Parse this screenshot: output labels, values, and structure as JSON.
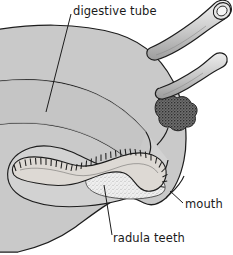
{
  "figure": {
    "background_color": "#ffffff",
    "width": 233,
    "height": 255
  },
  "labels": {
    "digestive_tube": "digestive tube",
    "mouth": "mouth",
    "radula_teeth": "radula teeth"
  },
  "colors": {
    "body_fill": "#c9c9c9",
    "body_fill_light": "#d6d6d6",
    "digestive_tube_fill": "#c2c2c2",
    "buccal_mass_fill": "#cfcfcf",
    "odontophore_fill": "#ececec",
    "radula_fill": "#e2e2e2",
    "salivary_gland_fill": "#6a6a6a",
    "tentacle_fill": "#d3d3d3",
    "outline": "#1d1d1d",
    "leader_line": "#1d1d1d",
    "text": "#1a1a1a"
  },
  "parts": [
    {
      "name": "head-body",
      "label": "head body mass"
    },
    {
      "name": "digestive-tube",
      "label": "digestive tube"
    },
    {
      "name": "buccal-mass",
      "label": "buccal mass"
    },
    {
      "name": "radula-ribbon",
      "label": "radula ribbon with teeth"
    },
    {
      "name": "odontophore",
      "label": "odontophore"
    },
    {
      "name": "salivary-gland",
      "label": "salivary gland"
    },
    {
      "name": "upper-tentacle",
      "label": "upper tentacle with eye"
    },
    {
      "name": "lower-tentacle",
      "label": "lower tentacle"
    },
    {
      "name": "mouth-opening",
      "label": "mouth"
    }
  ],
  "leaders": [
    {
      "name": "leader-digestive-tube",
      "from": "digestive tube label",
      "to": "digestive tube lumen"
    },
    {
      "name": "leader-mouth",
      "from": "mouth label",
      "to": "mouth opening"
    },
    {
      "name": "leader-radula-teeth",
      "from": "radula teeth label",
      "to": "odontophore teeth"
    }
  ]
}
